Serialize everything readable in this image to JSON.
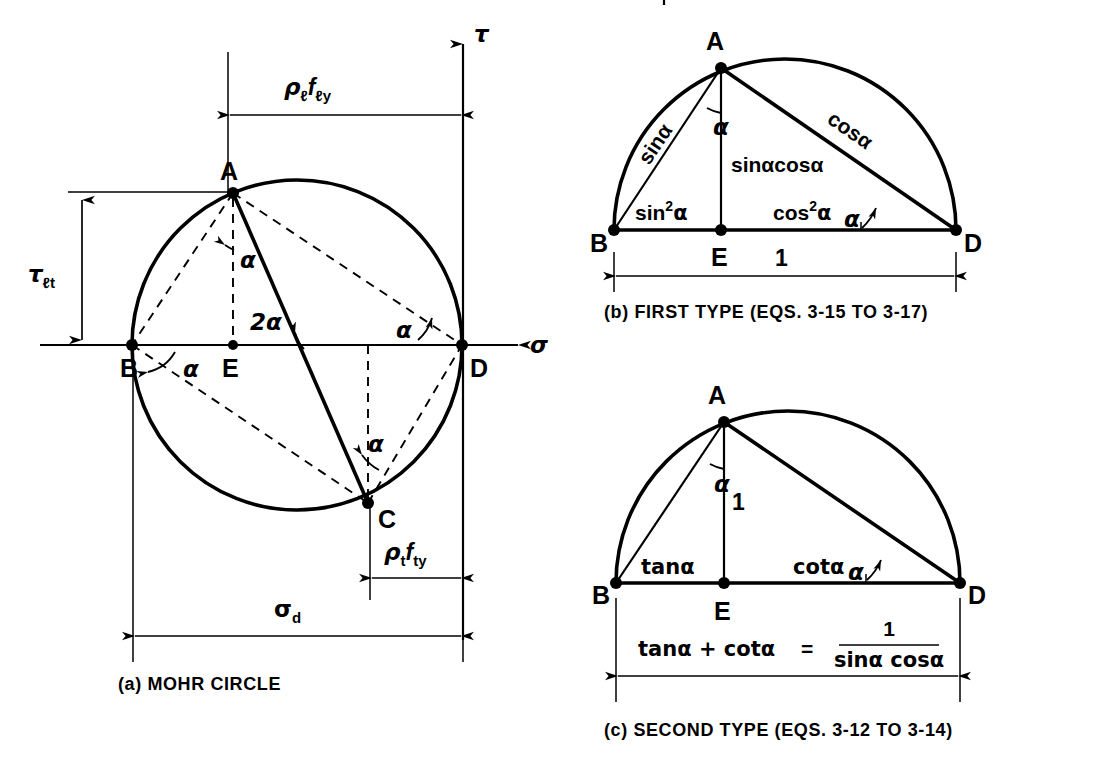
{
  "figure": {
    "kind": "technical-line-drawing",
    "background_color": "#ffffff",
    "ink_color": "#000000"
  },
  "panel_a": {
    "caption": "(a)  MOHR CIRCLE",
    "caption_index": "(a)",
    "caption_text": "MOHR CIRCLE",
    "axes": {
      "horizontal_label": "σ",
      "vertical_label": "τ"
    },
    "points": [
      {
        "name": "A",
        "label": "A"
      },
      {
        "name": "B",
        "label": "B"
      },
      {
        "name": "C",
        "label": "C"
      },
      {
        "name": "D",
        "label": "D"
      },
      {
        "name": "E",
        "label": "E"
      }
    ],
    "angles": [
      {
        "id": "angle-at-A",
        "label": "α"
      },
      {
        "id": "angle-at-B",
        "label": "α"
      },
      {
        "id": "angle-at-D",
        "label": "α"
      },
      {
        "id": "angle-at-C",
        "label": "α"
      },
      {
        "id": "angle-center",
        "label": "2α"
      }
    ],
    "dimensions": [
      {
        "id": "rho-l-fly",
        "base": "ρ",
        "base_sub": "ℓ",
        "second": "f",
        "second_sub": "ℓy",
        "text": "ρℓ fℓy"
      },
      {
        "id": "tau-lt",
        "base": "τ",
        "base_sub": "ℓt",
        "text": "τℓt"
      },
      {
        "id": "rho-t-fty",
        "base": "ρ",
        "base_sub": "t",
        "second": "f",
        "second_sub": "ty",
        "text": "ρt fty"
      },
      {
        "id": "sigma-d",
        "base": "σ",
        "base_sub": "d",
        "text": "σd"
      }
    ]
  },
  "panel_b": {
    "caption": "(b)  FIRST TYPE (EQS. 3-15 TO 3-17)",
    "caption_index": "(b)",
    "caption_text": "FIRST TYPE (EQS. 3-15 TO 3-17)",
    "points": [
      {
        "name": "A",
        "label": "A"
      },
      {
        "name": "B",
        "label": "B"
      },
      {
        "name": "D",
        "label": "D"
      },
      {
        "name": "E",
        "label": "E"
      }
    ],
    "angles": [
      {
        "id": "angle-at-A",
        "label": "α"
      },
      {
        "id": "angle-at-D",
        "label": "α"
      }
    ],
    "edge_labels": {
      "ab": "sinα",
      "ad": "cosα",
      "ae": "sinαcosα",
      "be": {
        "fn": "sin",
        "sup": "2",
        "arg": "α",
        "text": "sin²α"
      },
      "ed": {
        "fn": "cos",
        "sup": "2",
        "arg": "α",
        "text": "cos²α"
      }
    },
    "dimension": {
      "id": "unit-span",
      "label": "1"
    }
  },
  "panel_c": {
    "caption": "(c)  SECOND TYPE (EQS. 3-12 TO 3-14)",
    "caption_index": "(c)",
    "caption_text": "SECOND TYPE (EQS. 3-12 TO 3-14)",
    "points": [
      {
        "name": "A",
        "label": "A"
      },
      {
        "name": "B",
        "label": "B"
      },
      {
        "name": "D",
        "label": "D"
      },
      {
        "name": "E",
        "label": "E"
      }
    ],
    "angles": [
      {
        "id": "angle-at-A",
        "label": "α"
      },
      {
        "id": "angle-at-D",
        "label": "α"
      }
    ],
    "edge_labels": {
      "ae": "1",
      "be": "tanα",
      "ed": "cotα"
    },
    "identity": {
      "lhs": "tanα + cotα",
      "equals": "=",
      "numerator": "1",
      "denominator": "sinα cosα",
      "text": "tanα + cotα = 1 / (sinα cosα)"
    }
  }
}
